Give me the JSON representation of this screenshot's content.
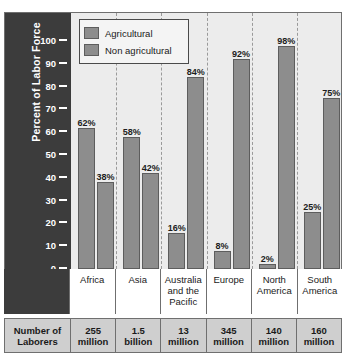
{
  "chart_data": {
    "type": "bar",
    "title": "",
    "xlabel": "",
    "ylabel": "Percent of Labor Force",
    "ylim": [
      0,
      100
    ],
    "yticks": [
      100,
      90,
      80,
      70,
      60,
      50,
      40,
      30,
      20,
      10,
      0
    ],
    "grid": false,
    "legend_position": "top-left",
    "categories": [
      "Africa",
      "Asia",
      "Australia and the Pacific",
      "Europe",
      "North America",
      "South America"
    ],
    "series": [
      {
        "name": "Agricultural",
        "values": [
          62,
          58,
          16,
          8,
          2,
          25
        ],
        "labels": [
          "62%",
          "58%",
          "16%",
          "8%",
          "2%",
          "25%"
        ],
        "color": "#8d8d8d"
      },
      {
        "name": "Non agricultural",
        "values": [
          38,
          42,
          84,
          92,
          98,
          75
        ],
        "labels": [
          "38%",
          "42%",
          "84%",
          "92%",
          "98%",
          "75%"
        ],
        "color": "#8d8d8d"
      }
    ],
    "annotations": {
      "row_header": "Number of Laborers",
      "row_values": [
        "255 million",
        "1.5 billion",
        "13 million",
        "345 million",
        "140 million",
        "160 million"
      ]
    }
  },
  "chart": {
    "y_axis_title": "Percent of Labor Force",
    "y_ticks": [
      "100",
      "90",
      "80",
      "70",
      "60",
      "50",
      "40",
      "30",
      "20",
      "10",
      "0"
    ],
    "legend": [
      {
        "label": "Agricultural",
        "swatch": "#8d8d8d"
      },
      {
        "label": "Non agricultural",
        "swatch": "#8d8d8d"
      }
    ],
    "groups": [
      {
        "category": "Africa",
        "category_lines": [
          "Africa"
        ],
        "agricultural": {
          "value": 62,
          "label": "62%"
        },
        "non_agricultural": {
          "value": 38,
          "label": "38%"
        },
        "laborers_line1": "255",
        "laborers_line2": "million"
      },
      {
        "category": "Asia",
        "category_lines": [
          "Asia"
        ],
        "agricultural": {
          "value": 58,
          "label": "58%"
        },
        "non_agricultural": {
          "value": 42,
          "label": "42%"
        },
        "laborers_line1": "1.5",
        "laborers_line2": "billion"
      },
      {
        "category": "Australia and the Pacific",
        "category_lines": [
          "Australia",
          "and the",
          "Pacific"
        ],
        "agricultural": {
          "value": 16,
          "label": "16%"
        },
        "non_agricultural": {
          "value": 84,
          "label": "84%"
        },
        "laborers_line1": "13",
        "laborers_line2": "million"
      },
      {
        "category": "Europe",
        "category_lines": [
          "Europe"
        ],
        "agricultural": {
          "value": 8,
          "label": "8%"
        },
        "non_agricultural": {
          "value": 92,
          "label": "92%"
        },
        "laborers_line1": "345",
        "laborers_line2": "million"
      },
      {
        "category": "North America",
        "category_lines": [
          "North",
          "America"
        ],
        "agricultural": {
          "value": 2,
          "label": "2%"
        },
        "non_agricultural": {
          "value": 98,
          "label": "98%"
        },
        "laborers_line1": "140",
        "laborers_line2": "million"
      },
      {
        "category": "South America",
        "category_lines": [
          "South",
          "America"
        ],
        "agricultural": {
          "value": 25,
          "label": "25%"
        },
        "non_agricultural": {
          "value": 75,
          "label": "75%"
        },
        "laborers_line1": "160",
        "laborers_line2": "million"
      }
    ],
    "table": {
      "row_header_line1": "Number of",
      "row_header_line2": "Laborers"
    }
  },
  "colors": {
    "axis_panel": "#3c3c3c",
    "plot_background": "#ececec",
    "bar_fill": "#8d8d8d",
    "bar_stroke": "#5d5d5d",
    "frame": "#6f6f6f",
    "table_fill": "#cfcfcf"
  }
}
